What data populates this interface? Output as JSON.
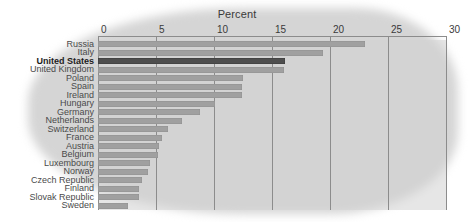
{
  "chart_data": {
    "type": "bar",
    "title": "Percent",
    "xlabel": "Percent",
    "ylabel": "",
    "orientation": "horizontal",
    "xlim": [
      0,
      30
    ],
    "xticks": [
      0,
      5,
      10,
      15,
      20,
      25,
      30
    ],
    "xtick_labels": [
      "0",
      "5",
      "10",
      "15",
      "20",
      "25",
      "30"
    ],
    "grid": true,
    "legend": false,
    "highlight_category": "United States",
    "colors": {
      "bar": "#a0a0a0",
      "highlight_bar": "#4e4e4e",
      "plot_background": "#d5d5d5",
      "gridline": "#8c8c8c",
      "text": "#4a4a4a"
    },
    "categories": [
      "Russia",
      "Italy",
      "United States",
      "United Kingdom",
      "Poland",
      "Spain",
      "Ireland",
      "Hungary",
      "Germany",
      "Netherlands",
      "Switzerland",
      "France",
      "Austria",
      "Belgium",
      "Luxembourg",
      "Norway",
      "Czech Republic",
      "Finland",
      "Slovak Republic",
      "Sweden"
    ],
    "values": [
      23.0,
      19.4,
      16.1,
      16.0,
      12.5,
      12.4,
      12.4,
      10.1,
      8.8,
      7.2,
      6.0,
      5.5,
      5.3,
      5.2,
      4.5,
      4.3,
      3.8,
      3.5,
      3.5,
      2.6
    ]
  }
}
